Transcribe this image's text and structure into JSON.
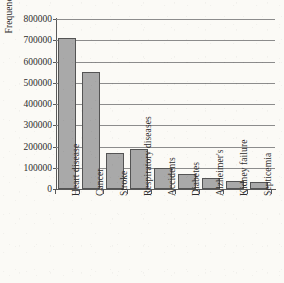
{
  "chart_data": {
    "type": "bar",
    "title": "",
    "xlabel": "",
    "ylabel": "Frequency f",
    "ylabel_text": "Frequency",
    "ylabel_italic": "f",
    "categories": [
      "Heart disease",
      "Cancer",
      "Stroke",
      "Respiratory diseases",
      "Accidents",
      "Diabetes",
      "Alzheimer's",
      "Kidney failure",
      "Septicemia"
    ],
    "values": [
      710000,
      553000,
      168000,
      189000,
      99000,
      71000,
      50000,
      38000,
      31000
    ],
    "ylim": [
      0,
      800000
    ],
    "ytick_labels": [
      "0",
      "100000",
      "200000",
      "300000",
      "400000",
      "500000",
      "600000",
      "700000",
      "800000"
    ],
    "ytick_values": [
      0,
      100000,
      200000,
      300000,
      400000,
      500000,
      600000,
      700000,
      800000
    ],
    "grid": true,
    "legend": false,
    "bar_color": "#a9a9a9",
    "bar_edge_color": "#545454",
    "axis_color": "#5a5a5a",
    "grid_color": "#8c8c8c",
    "background_color": "#fbfaf6"
  }
}
